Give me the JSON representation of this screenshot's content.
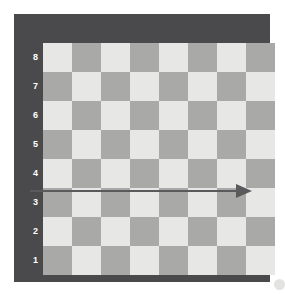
{
  "figure": {
    "background_color": "#ffffff",
    "width": 285,
    "height": 294
  },
  "board": {
    "frame_color": "#4a4a4c",
    "light_square_color": "#e7e7e5",
    "dark_square_color": "#a9a9a7",
    "files": [
      "A",
      "B",
      "C",
      "D",
      "E",
      "F",
      "G",
      "H"
    ],
    "ranks": [
      "8",
      "7",
      "6",
      "5",
      "4",
      "3",
      "2",
      "1"
    ],
    "label_color": "#ffffff",
    "squares_per_side": 8,
    "corner_marker": {
      "name": "corner-dot",
      "color": "#e3e3e1",
      "position": "bottom-right"
    }
  },
  "chart_data": {
    "type": "diagram",
    "grid_rows": 8,
    "grid_cols": 8,
    "x_tick_labels": [
      "A",
      "B",
      "C",
      "D",
      "E",
      "F",
      "G",
      "H"
    ],
    "y_tick_labels": [
      "8",
      "7",
      "6",
      "5",
      "4",
      "3",
      "2",
      "1"
    ],
    "square_colors": {
      "light": "#e7e7e5",
      "dark": "#a9a9a7"
    },
    "a1_square_shade": "dark",
    "a8_square_shade": "light",
    "annotations": [
      {
        "name": "rank-3-arrow",
        "type": "arrow",
        "color": "#5a5a5c",
        "rank": "3",
        "from_file": "A",
        "to_file": "H",
        "direction": "right",
        "shaft_thickness_px": 2,
        "head_style": "solid-triangle"
      }
    ],
    "legend": [],
    "grid": true
  },
  "arrow": {
    "color": "#5a5a5c",
    "x_start": 30,
    "x_end": 252,
    "y": 191,
    "shaft_width": 2,
    "head_length": 16,
    "head_half_height": 7
  }
}
